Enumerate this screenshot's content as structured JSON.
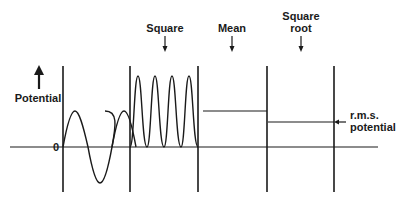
{
  "diagram": {
    "axis": {
      "y_label": "Potential",
      "zero_label": "0"
    },
    "steps": [
      {
        "label": "Square"
      },
      {
        "label": "Mean"
      },
      {
        "label": "Square root",
        "line1": "Square",
        "line2": "root"
      }
    ],
    "result": {
      "line1": "r.m.s.",
      "line2": "potential"
    },
    "colors": {
      "ink": "#1a1a1a",
      "background": "#ffffff"
    }
  }
}
